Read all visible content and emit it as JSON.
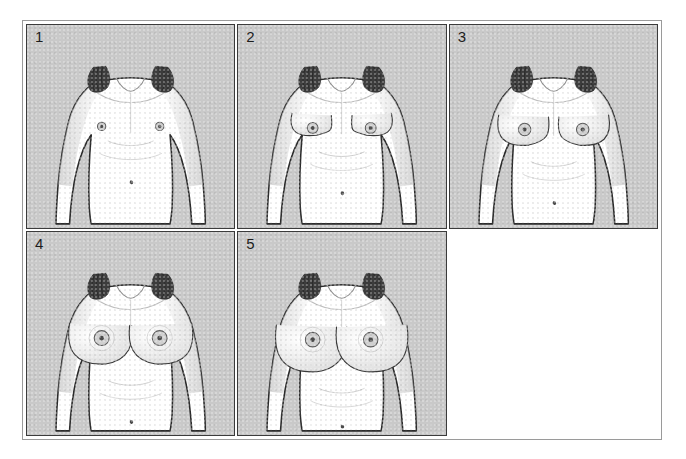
{
  "figure": {
    "kind": "medical-illustration-plate",
    "grid": {
      "columns": 3,
      "rows": 2,
      "filled_cells": 5,
      "empty_cells": 1
    },
    "colors": {
      "page_background": "#ffffff",
      "plate_border": "#9a9a9a",
      "panel_border": "#3b3b3b",
      "panel_background": "#c9c9c9",
      "skin_fill": "#ffffff",
      "line_art": "#2b2b2b",
      "hair": "#3a3a3a",
      "areola": "#6e6e6e",
      "shading": "#d8d8d8",
      "number_text": "#1d1d1d"
    }
  },
  "panels": [
    {
      "number": "1",
      "label": "1",
      "stage_description": "Prepubertal: flat chest, elevation of papilla only",
      "breast_size": 0,
      "areola_size": 6,
      "empty": false
    },
    {
      "number": "2",
      "label": "2",
      "stage_description": "Breast bud stage: small mound, areola widening",
      "breast_size": 1,
      "areola_size": 8,
      "empty": false
    },
    {
      "number": "3",
      "label": "3",
      "stage_description": "Further enlargement of breast and areola, no separate contour",
      "breast_size": 2,
      "areola_size": 9,
      "empty": false
    },
    {
      "number": "4",
      "label": "4",
      "stage_description": "Areola and papilla project to form a secondary mound",
      "breast_size": 3,
      "areola_size": 11,
      "empty": false
    },
    {
      "number": "5",
      "label": "5",
      "stage_description": "Mature stage: areola recessed to general breast contour",
      "breast_size": 4,
      "areola_size": 11,
      "empty": false
    },
    {
      "number": "",
      "label": "",
      "stage_description": "",
      "breast_size": 0,
      "areola_size": 0,
      "empty": true
    }
  ]
}
